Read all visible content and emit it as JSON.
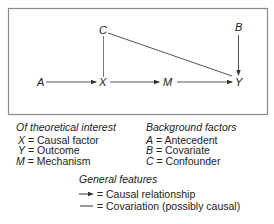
{
  "diagram": {
    "nodes": {
      "A": {
        "label": "A",
        "x": 40,
        "y": 86
      },
      "X": {
        "label": "X",
        "x": 103,
        "y": 86
      },
      "M": {
        "label": "M",
        "x": 168,
        "y": 86
      },
      "Y": {
        "label": "Y",
        "x": 239,
        "y": 86
      },
      "C": {
        "label": "C",
        "x": 103,
        "y": 35
      },
      "B": {
        "label": "B",
        "x": 239,
        "y": 32
      }
    },
    "edges": [
      {
        "from": "A",
        "to": "X",
        "type": "causal"
      },
      {
        "from": "X",
        "to": "M",
        "type": "causal"
      },
      {
        "from": "M",
        "to": "Y",
        "type": "causal"
      },
      {
        "from": "B",
        "to": "Y",
        "type": "causal"
      },
      {
        "from": "C",
        "to": "X",
        "type": "covariation"
      },
      {
        "from": "C",
        "to": "Y",
        "type": "covariation"
      }
    ],
    "line_color": "#555555",
    "border_color": "#8a8a8a"
  },
  "legend": {
    "theory": {
      "heading": "Of theoretical interest",
      "items": [
        {
          "sym": "X",
          "text": " = Causal factor"
        },
        {
          "sym": "Y",
          "text": " = Outcome"
        },
        {
          "sym": "M",
          "text": " = Mechanism"
        }
      ]
    },
    "background": {
      "heading": "Background factors",
      "items": [
        {
          "sym": "A",
          "text": " = Antecedent"
        },
        {
          "sym": "B",
          "text": " = Covariate"
        },
        {
          "sym": "C",
          "text": " = Confounder"
        }
      ]
    },
    "general": {
      "heading": "General features",
      "items": [
        {
          "icon": "arrow-icon",
          "text": " = Causal relationship"
        },
        {
          "icon": "line-icon",
          "text": " = Covariation (possibly causal)"
        }
      ]
    }
  }
}
